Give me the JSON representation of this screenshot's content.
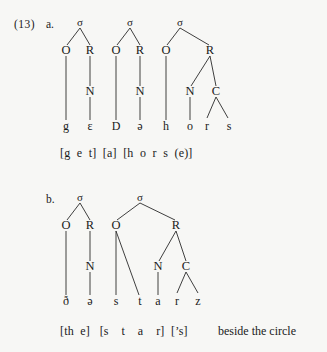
{
  "example": {
    "number_label": "(13)",
    "items": [
      {
        "letter": "a."
      },
      {
        "letter": "b."
      }
    ]
  },
  "symbols": {
    "sigma": "σ",
    "onset": "O",
    "rhyme": "R",
    "nucleus": "N",
    "coda": "C"
  },
  "panel_a": {
    "letter": "a.",
    "syllable_count": 3,
    "sigma_labels": [
      "σ",
      "σ",
      "σ"
    ],
    "tier_nodes": [
      "O",
      "R",
      "O",
      "R",
      "O",
      "R"
    ],
    "nuclei_coda": [
      "N",
      "N",
      "N",
      "C"
    ],
    "segments": [
      "g",
      "ɛ",
      "D",
      "ə",
      "h",
      "o",
      "r",
      "s"
    ],
    "gloss": "[g  e  t]  [a]  [h  o  r  s  (e)]"
  },
  "panel_b": {
    "letter": "b.",
    "syllable_count": 2,
    "sigma_labels": [
      "σ",
      "σ"
    ],
    "tier_nodes": [
      "O",
      "R",
      "O",
      "R"
    ],
    "nuclei_coda": [
      "N",
      "N",
      "C"
    ],
    "segments": [
      "ð",
      "ə",
      "s",
      "t",
      "a",
      "r",
      "z"
    ],
    "gloss": "[th  e]   [s    t    a    r]  [’s]",
    "trailing_text": "beside the circle"
  },
  "colors": {
    "background": "#f7f7f5",
    "text": "#1a1a1a",
    "line": "#2a2a2a"
  }
}
